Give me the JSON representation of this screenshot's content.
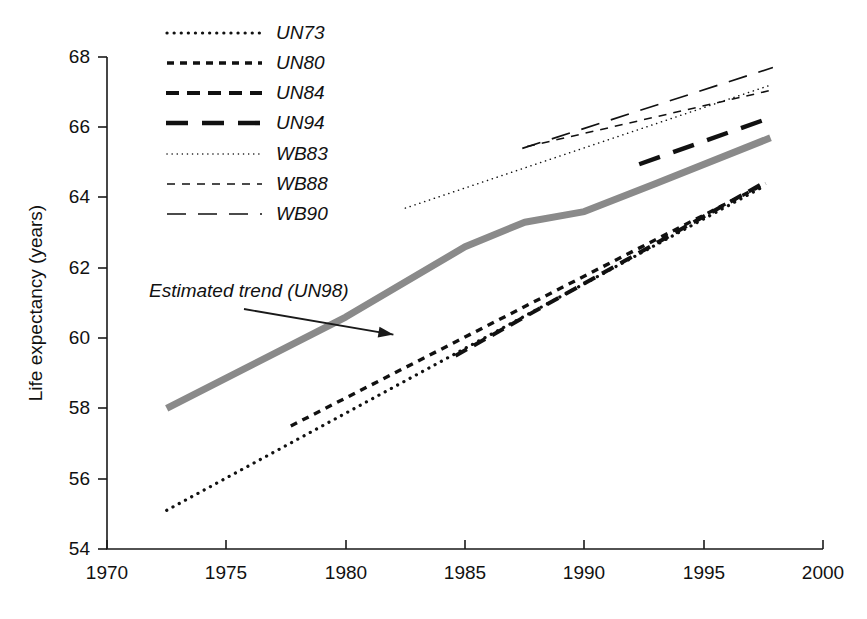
{
  "chart_data": {
    "type": "line",
    "title": "",
    "xlabel": "",
    "ylabel": "Life expectancy (years)",
    "xlim": [
      1970,
      2000
    ],
    "ylim": [
      54,
      68
    ],
    "xticks": [
      1970,
      1975,
      1980,
      1985,
      1990,
      1995,
      2000
    ],
    "yticks": [
      54,
      56,
      58,
      60,
      62,
      64,
      66,
      68
    ],
    "grid": false,
    "legend_position": "top-left-inside",
    "annotations": [
      {
        "text": "Estimated trend (UN98)",
        "x": 1976.0,
        "y": 61.6,
        "points_to_x": 1982.0,
        "points_to_y": 60.1
      }
    ],
    "series": [
      {
        "name": "UN73",
        "style": "dotted",
        "linewidth": 2,
        "color": "#111111",
        "x": [
          1972.5,
          1997.6
        ],
        "y": [
          55.1,
          64.35
        ]
      },
      {
        "name": "UN80",
        "style": "dashed-short",
        "linewidth": 2.5,
        "color": "#111111",
        "x": [
          1977.7,
          1997.6
        ],
        "y": [
          57.5,
          64.4
        ]
      },
      {
        "name": "UN84",
        "style": "dashed-medium",
        "linewidth": 3,
        "color": "#111111",
        "x": [
          1984.6,
          1997.6
        ],
        "y": [
          59.5,
          64.45
        ]
      },
      {
        "name": "UN94",
        "style": "dashed-long",
        "linewidth": 3.5,
        "color": "#111111",
        "x": [
          1992.3,
          1997.7
        ],
        "y": [
          64.95,
          66.25
        ]
      },
      {
        "name": "WB83",
        "style": "dotted-fine",
        "linewidth": 1.1,
        "color": "#111111",
        "x": [
          1982.5,
          1997.8
        ],
        "y": [
          63.7,
          67.2
        ]
      },
      {
        "name": "WB88",
        "style": "dashed-fine-short",
        "linewidth": 1.1,
        "color": "#111111",
        "x": [
          1987.6,
          1997.8
        ],
        "y": [
          65.45,
          67.05
        ]
      },
      {
        "name": "WB90",
        "style": "dashed-fine-long",
        "linewidth": 1.2,
        "color": "#111111",
        "x": [
          1987.4,
          1997.9
        ],
        "y": [
          65.4,
          67.7
        ]
      },
      {
        "name": "Estimated trend (UN98)",
        "style": "solid-thick-gray",
        "linewidth": 7,
        "color": "#8a8a8a",
        "x": [
          1972.5,
          1980.0,
          1985.0,
          1987.5,
          1990.0,
          1993.0,
          1997.8
        ],
        "y": [
          58.0,
          60.6,
          62.6,
          63.3,
          63.6,
          64.4,
          65.7
        ]
      }
    ]
  },
  "axes": {
    "y_title": "Life expectancy (years)",
    "y_tick_labels": [
      "68",
      "66",
      "64",
      "62",
      "60",
      "58",
      "56",
      "54"
    ],
    "x_tick_labels": [
      "1970",
      "1975",
      "1980",
      "1985",
      "1990",
      "1995",
      "2000"
    ]
  },
  "legend": {
    "entries": [
      {
        "label": "UN73",
        "style": "dotted"
      },
      {
        "label": "UN80",
        "style": "dashed-short"
      },
      {
        "label": "UN84",
        "style": "dashed-medium"
      },
      {
        "label": "UN94",
        "style": "dashed-long"
      },
      {
        "label": "WB83",
        "style": "dotted-fine"
      },
      {
        "label": "WB88",
        "style": "dashed-fine-short"
      },
      {
        "label": "WB90",
        "style": "dashed-fine-long"
      }
    ]
  },
  "annotation": {
    "text": "Estimated trend (UN98)"
  }
}
